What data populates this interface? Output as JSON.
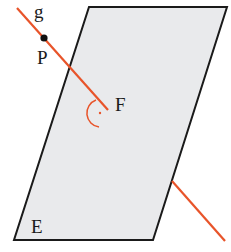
{
  "diagram": {
    "plane": {
      "label": "E",
      "fill": "#e9eaec",
      "stroke": "#1a1a1a",
      "corners": [
        [
          89,
          7
        ],
        [
          227,
          7
        ],
        [
          153,
          240
        ],
        [
          14,
          240
        ]
      ]
    },
    "line": {
      "label": "g",
      "color": "#e8542a",
      "start": [
        17,
        8
      ],
      "end": [
        225,
        241
      ],
      "hidden_from": [
        108,
        110
      ],
      "hidden_to": [
        172,
        180
      ]
    },
    "point_p": {
      "label": "P",
      "x": 44,
      "y": 38
    },
    "foot_point": {
      "label": "F",
      "x": 108,
      "y": 110
    },
    "right_angle_marker": {
      "color": "#e8542a"
    },
    "labels": {
      "g": "g",
      "P": "P",
      "F": "F",
      "E": "E"
    }
  }
}
